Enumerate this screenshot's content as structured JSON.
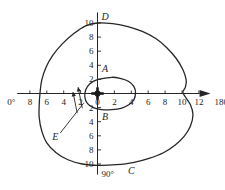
{
  "figure": {
    "type": "polar-radiation-pattern",
    "background_color": "#ffffff",
    "line_color": "#262626"
  },
  "chart_data": {
    "type": "line",
    "title": "",
    "xlabel": "",
    "ylabel": "",
    "xlim": [
      -9.5,
      13.5
    ],
    "ylim": [
      -11.5,
      11.5
    ],
    "grid": false,
    "legend_position": "none",
    "axes": {
      "horizontal": {
        "left_end_label": "0°",
        "right_end_label": "180°",
        "left_ticks": [
          "8",
          "6",
          "4",
          "2"
        ],
        "origin_tick": "0",
        "right_ticks": [
          "2",
          "4",
          "6",
          "8",
          "10",
          "12"
        ],
        "left_tick_values": [
          -8,
          -6,
          -4,
          -2
        ],
        "right_tick_values": [
          2,
          4,
          6,
          8,
          10,
          12
        ],
        "arrow": "right"
      },
      "vertical": {
        "top_end_label": "",
        "bottom_end_label": "90°",
        "top_ticks": [
          "2",
          "4",
          "6",
          "8",
          "10"
        ],
        "bottom_ticks": [
          "2",
          "4",
          "6",
          "8",
          "10"
        ],
        "top_tick_values": [
          2,
          4,
          6,
          8,
          10
        ],
        "bottom_tick_values": [
          -2,
          -4,
          -6,
          -8,
          -10
        ]
      }
    },
    "origin_marker": "cross-marker",
    "series": [
      {
        "name": "outer-pattern",
        "label": "",
        "closed": true,
        "points": [
          [
            0.0,
            10.0
          ],
          [
            1.8,
            9.9
          ],
          [
            3.6,
            9.5
          ],
          [
            5.3,
            8.8
          ],
          [
            6.9,
            7.8
          ],
          [
            8.2,
            6.5
          ],
          [
            9.3,
            5.0
          ],
          [
            10.1,
            3.4
          ],
          [
            10.5,
            1.9
          ],
          [
            10.4,
            0.9
          ],
          [
            10.1,
            0.2
          ],
          [
            10.4,
            -0.5
          ],
          [
            11.0,
            -1.6
          ],
          [
            11.3,
            -3.0
          ],
          [
            11.0,
            -4.6
          ],
          [
            10.3,
            -6.0
          ],
          [
            9.2,
            -7.3
          ],
          [
            7.8,
            -8.4
          ],
          [
            6.1,
            -9.2
          ],
          [
            4.2,
            -9.8
          ],
          [
            2.2,
            -10.1
          ],
          [
            0.2,
            -10.2
          ],
          [
            -1.8,
            -10.0
          ],
          [
            -3.5,
            -9.4
          ],
          [
            -4.9,
            -8.4
          ],
          [
            -6.0,
            -7.0
          ],
          [
            -6.6,
            -5.3
          ],
          [
            -6.9,
            -3.4
          ],
          [
            -6.9,
            -1.6
          ],
          [
            -6.8,
            0.1
          ],
          [
            -6.6,
            1.9
          ],
          [
            -6.1,
            3.7
          ],
          [
            -5.3,
            5.4
          ],
          [
            -4.2,
            7.0
          ],
          [
            -2.8,
            8.5
          ],
          [
            -1.4,
            9.6
          ],
          [
            0.0,
            10.0
          ]
        ]
      },
      {
        "name": "inner-pattern",
        "label": "",
        "closed": true,
        "points": [
          [
            1.7,
            2.3
          ],
          [
            2.8,
            2.1
          ],
          [
            3.7,
            1.7
          ],
          [
            4.3,
            1.0
          ],
          [
            4.5,
            0.1
          ],
          [
            4.3,
            -0.9
          ],
          [
            3.7,
            -1.6
          ],
          [
            2.8,
            -2.1
          ],
          [
            1.7,
            -2.3
          ],
          [
            0.5,
            -2.3
          ],
          [
            -0.5,
            -2.0
          ],
          [
            -1.2,
            -1.4
          ],
          [
            -1.5,
            -0.5
          ],
          [
            -1.4,
            0.5
          ],
          [
            -0.9,
            1.4
          ],
          [
            0.1,
            2.0
          ],
          [
            1.7,
            2.3
          ]
        ]
      }
    ],
    "annotations": [
      {
        "name": "label-A",
        "text": "A",
        "x": 0.9,
        "y": 3.5
      },
      {
        "name": "label-B",
        "text": "B",
        "x": 0.9,
        "y": -3.4
      },
      {
        "name": "label-C",
        "text": "C",
        "x": 4.0,
        "y": -11.0
      },
      {
        "name": "label-D",
        "text": "D",
        "x": 0.9,
        "y": 10.9
      },
      {
        "name": "label-E",
        "text": "E",
        "x": -5.0,
        "y": -6.2
      },
      {
        "name": "leader-line-E",
        "from": [
          -4.4,
          -5.6
        ],
        "to": [
          -1.6,
          -1.3
        ]
      },
      {
        "name": "direction-arrow-1",
        "from": [
          -1.8,
          -2.1
        ],
        "to": [
          -2.3,
          0.9
        ]
      },
      {
        "name": "direction-arrow-2",
        "from": [
          -2.4,
          -2.8
        ],
        "to": [
          -2.9,
          0.2
        ]
      }
    ]
  }
}
